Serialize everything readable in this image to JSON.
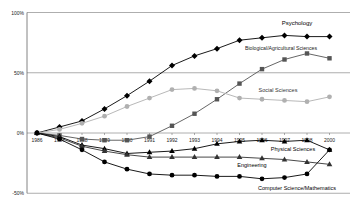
{
  "chart_data": {
    "type": "line",
    "title": "",
    "xlabel": "",
    "ylabel": "",
    "ylim": [
      -50,
      100
    ],
    "yticks": [
      "100%",
      "50%",
      "0%",
      "-50%"
    ],
    "ytick_values": [
      100,
      50,
      0,
      -50
    ],
    "x": [
      "1986",
      "1987",
      "1988",
      "1989",
      "1990",
      "1991",
      "1992",
      "1993",
      "1994",
      "1995",
      "1996",
      "1997",
      "1998",
      "1999"
    ],
    "x_tick_labels": [
      "1986",
      "1987",
      "1988",
      "1989",
      "1990",
      "1991",
      "1992",
      "1993",
      "1994",
      "1995",
      "1996",
      "1997",
      "1998",
      "2000"
    ],
    "grid": true,
    "legend": "inline labels",
    "series": [
      {
        "name": "Psychology",
        "color": "#000000",
        "marker": "diamond",
        "values": [
          0,
          5,
          10,
          20,
          31,
          43,
          56,
          64,
          70,
          77,
          79,
          81,
          80,
          80
        ]
      },
      {
        "name": "Biological/Agricultural Sciences",
        "color": "#555555",
        "marker": "square",
        "values": [
          0,
          -2,
          -5,
          -6,
          -6,
          -3,
          6,
          16,
          28,
          41,
          53,
          61,
          66,
          62
        ]
      },
      {
        "name": "Social Sciences",
        "color": "#b0b0b0",
        "marker": "circle",
        "values": [
          0,
          3,
          8,
          14,
          22,
          29,
          36,
          37,
          35,
          29,
          28,
          27,
          26,
          30
        ]
      },
      {
        "name": "Physical Sciences",
        "color": "#000000",
        "marker": "triangle",
        "values": [
          0,
          -3,
          -10,
          -13,
          -17,
          -16,
          -15,
          -13,
          -9,
          -7,
          -6,
          -7,
          -6,
          -14
        ]
      },
      {
        "name": "Engineering",
        "color": "#333333",
        "marker": "triangle",
        "values": [
          0,
          -4,
          -11,
          -15,
          -18,
          -20,
          -20,
          -20,
          -20,
          -20,
          -21,
          -22,
          -24,
          -26
        ]
      },
      {
        "name": "Computer Science/Mathematics",
        "color": "#000000",
        "marker": "circle",
        "values": [
          0,
          -5,
          -14,
          -24,
          -30,
          -34,
          -35,
          -35,
          -36,
          -36,
          -38,
          -37,
          -34,
          -14
        ]
      }
    ]
  },
  "labels": {
    "psychology": "Psychology",
    "bio": "Biological/Agricultural Sciences",
    "social": "Social Sciences",
    "physical": "Physical Sciences",
    "engineering": "Engineering",
    "cs": "Computer Science/Mathematics"
  }
}
